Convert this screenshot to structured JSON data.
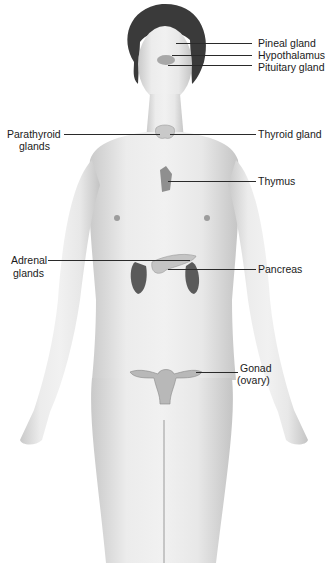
{
  "diagram": {
    "colors": {
      "background": "#ffffff",
      "skin": "#e6e6e6",
      "skin_shadow": "#bdbdbd",
      "hair": "#3a3a3a",
      "organ": "#bcbcbc",
      "kidney": "#5a5a5a",
      "leader_line": "#2a2a2a",
      "label_text": "#1a1a1a"
    },
    "labels": [
      {
        "id": "pineal",
        "text": "Pineal gland",
        "side": "right"
      },
      {
        "id": "hypothalamus",
        "text": "Hypothalamus",
        "side": "right"
      },
      {
        "id": "pituitary",
        "text": "Pituitary gland",
        "side": "right"
      },
      {
        "id": "parathyroid",
        "line1": "Parathyroid",
        "line2": "glands",
        "side": "left"
      },
      {
        "id": "thyroid",
        "text": "Thyroid gland",
        "side": "right"
      },
      {
        "id": "thymus",
        "text": "Thymus",
        "side": "right"
      },
      {
        "id": "adrenal",
        "line1": "Adrenal",
        "line2": "glands",
        "side": "left"
      },
      {
        "id": "pancreas",
        "text": "Pancreas",
        "side": "right"
      },
      {
        "id": "gonad",
        "line1": "Gonad",
        "line2": "(ovary)",
        "side": "right"
      }
    ]
  }
}
